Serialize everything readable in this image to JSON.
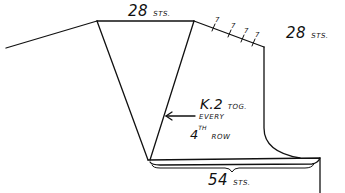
{
  "diagram": {
    "type": "knitting-schematic",
    "labels": {
      "top_count": "28",
      "top_unit": "STS.",
      "shoulder_count": "28",
      "shoulder_unit": "STS.",
      "bottom_count": "54",
      "bottom_unit": "STS.",
      "decrease_line1_a": "K.2",
      "decrease_line1_b": "TOG.",
      "decrease_line2": "EVERY",
      "decrease_line3_a": "4",
      "decrease_line3_sup": "TH",
      "decrease_line3_b": "ROW"
    },
    "shoulder_step_marks": [
      "7",
      "7",
      "7",
      "7"
    ],
    "colors": {
      "line": "#111111",
      "background": "#ffffff"
    }
  }
}
